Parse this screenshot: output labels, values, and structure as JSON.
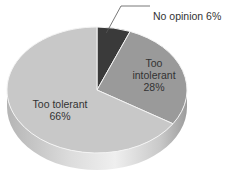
{
  "chart_data": {
    "type": "pie",
    "style": "3d",
    "title_clipped": "",
    "categories": [
      "No opinion",
      "Too intolerant",
      "Too tolerant"
    ],
    "values": [
      6,
      28,
      66
    ],
    "unit": "%",
    "start_angle": "12 o'clock, clockwise",
    "colors": [
      "#3a3a3a",
      "#9a9a9a",
      "#c8c8c8"
    ],
    "labels": [
      {
        "name": "No opinion",
        "value": "6%",
        "text": "No opinion  6%",
        "placement": "callout"
      },
      {
        "name_line1": "Too",
        "name_line2": "intolerant",
        "value": "28%",
        "placement": "inside"
      },
      {
        "name": "Too tolerant",
        "value": "66%",
        "placement": "inside"
      }
    ],
    "legend": "none"
  }
}
